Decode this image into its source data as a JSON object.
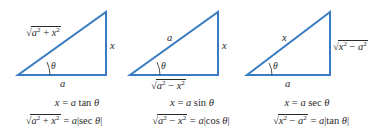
{
  "style": {
    "line_color": "#3a7cc0",
    "text_color": "#2a2a2a"
  },
  "triangles": [
    {
      "name": "tan-substitution",
      "hypotenuse": {
        "radicand_a": "a",
        "op": " + ",
        "radicand_b": "x"
      },
      "opposite": "x",
      "adjacent": "a",
      "angle": "θ",
      "substitution": {
        "lhs": "x",
        "eq": " = ",
        "coef": "a",
        "fn": " tan ",
        "var": "θ"
      },
      "identity": {
        "radicand_a": "a",
        "op": " + ",
        "radicand_b": "x",
        "eq": " = ",
        "coef": "a",
        "fn": "sec ",
        "var": "θ"
      }
    },
    {
      "name": "sin-substitution",
      "hypotenuse": "a",
      "opposite": "x",
      "adjacent": {
        "radicand_a": "a",
        "op": " − ",
        "radicand_b": "x"
      },
      "angle": "θ",
      "substitution": {
        "lhs": "x",
        "eq": " = ",
        "coef": "a",
        "fn": " sin ",
        "var": "θ"
      },
      "identity": {
        "radicand_a": "a",
        "op": " − ",
        "radicand_b": "x",
        "eq": " = ",
        "coef": "a",
        "fn": "cos ",
        "var": "θ"
      }
    },
    {
      "name": "sec-substitution",
      "hypotenuse": "x",
      "opposite": {
        "radicand_a": "x",
        "op": " − ",
        "radicand_b": "a"
      },
      "adjacent": "a",
      "angle": "θ",
      "substitution": {
        "lhs": "x",
        "eq": " = ",
        "coef": "a",
        "fn": " sec ",
        "var": "θ"
      },
      "identity": {
        "radicand_a": "x",
        "op": " − ",
        "radicand_b": "a",
        "eq": " = ",
        "coef": "a",
        "fn": "tan ",
        "var": "θ"
      }
    }
  ],
  "exponent": "2",
  "sqrt_symbol": "√",
  "abs_bar": "|"
}
